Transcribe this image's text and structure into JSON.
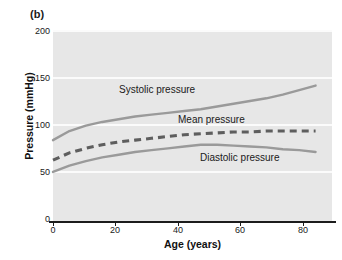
{
  "panel": {
    "label": "(b)"
  },
  "chart_data": {
    "type": "line",
    "title": "",
    "xlabel": "Age (years)",
    "ylabel": "Pressure (mmHg)",
    "xlim": [
      0,
      85
    ],
    "ylim": [
      0,
      210
    ],
    "xticks": [
      0,
      20,
      40,
      60,
      80
    ],
    "yticks": [
      0,
      50,
      100,
      150,
      200
    ],
    "grid": "horizontal-white",
    "legend": "inline-annotations",
    "x": [
      0,
      5,
      10,
      15,
      20,
      25,
      30,
      35,
      40,
      45,
      50,
      55,
      60,
      65,
      70,
      75,
      80
    ],
    "series": [
      {
        "name": "Systolic pressure",
        "style": "solid",
        "color": "#9a9a9a",
        "values": [
          90,
          100,
          106,
          110,
          113,
          116,
          118,
          120,
          122,
          124,
          127,
          130,
          133,
          136,
          140,
          145,
          150
        ]
      },
      {
        "name": "Mean pressure",
        "style": "dashed",
        "color": "#5e5e5e",
        "values": [
          68,
          76,
          81,
          85,
          88,
          90,
          92,
          94,
          96,
          97,
          98,
          99,
          99,
          100,
          100,
          100,
          100
        ]
      },
      {
        "name": "Diastolic pressure",
        "style": "solid",
        "color": "#9a9a9a",
        "values": [
          55,
          62,
          67,
          71,
          74,
          77,
          79,
          81,
          83,
          85,
          85,
          84,
          83,
          82,
          80,
          79,
          77
        ]
      }
    ]
  },
  "annotations": {
    "systolic": "Systolic pressure",
    "mean": "Mean pressure",
    "diastolic": "Diastolic pressure"
  },
  "axis": {
    "y_tick_labels": [
      "200",
      "150",
      "100",
      "50",
      "0"
    ],
    "x_tick_labels": [
      "0",
      "20",
      "40",
      "60",
      "80"
    ]
  }
}
